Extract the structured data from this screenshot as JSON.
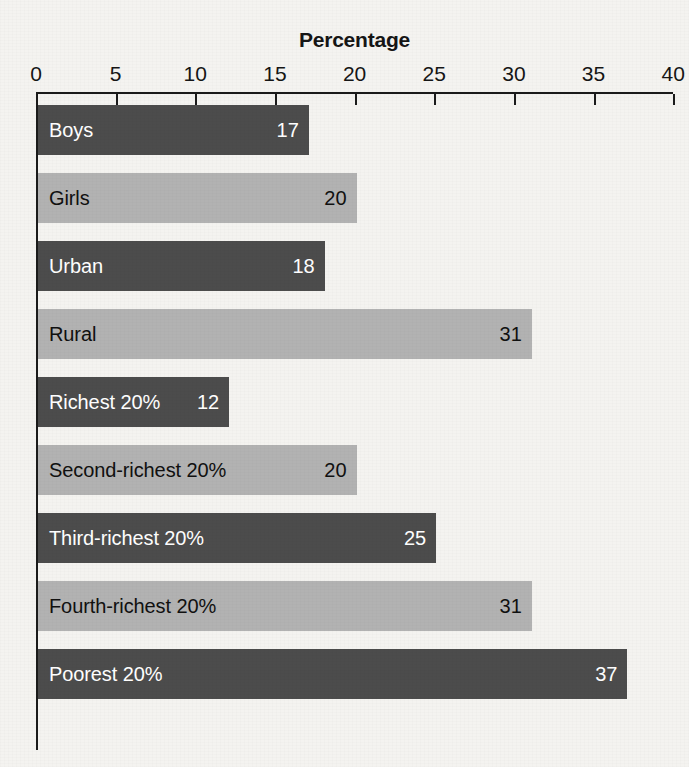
{
  "chart_data": {
    "type": "bar",
    "orientation": "horizontal",
    "title": "Percentage",
    "xlabel": "",
    "ylabel": "",
    "xlim": [
      0,
      40
    ],
    "xticks": [
      0,
      5,
      10,
      15,
      20,
      25,
      30,
      35,
      40
    ],
    "xtick_labels": [
      "0",
      "5",
      "10",
      "15",
      "20",
      "25",
      "30",
      "35",
      "40"
    ],
    "grid": false,
    "legend": "none",
    "categories": [
      "Boys",
      "Girls",
      "Urban",
      "Rural",
      "Richest 20%",
      "Second-richest 20%",
      "Third-richest 20%",
      "Fourth-richest 20%",
      "Poorest 20%"
    ],
    "values": [
      17,
      20,
      18,
      31,
      12,
      20,
      25,
      31,
      37
    ],
    "value_labels": [
      "17",
      "20",
      "18",
      "31",
      "12",
      "20",
      "25",
      "31",
      "37"
    ],
    "bar_styles": [
      "dark",
      "light",
      "dark",
      "light",
      "dark",
      "light",
      "dark",
      "light",
      "dark"
    ],
    "colors": {
      "dark_bar": "#4c4c4c",
      "light_bar": "#b2b2b2",
      "dark_bar_text": "#ffffff",
      "light_bar_text": "#101010",
      "axis": "#1b1b1b",
      "background": "#f4f3f0"
    }
  }
}
